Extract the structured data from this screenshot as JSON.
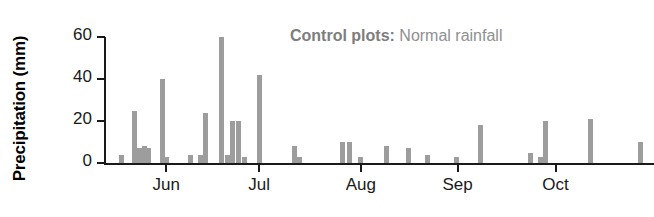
{
  "chart_data": {
    "type": "bar",
    "title": "",
    "subtitle": "",
    "xlabel": "",
    "ylabel": "Precipitation (mm)",
    "ylim": [
      0,
      60
    ],
    "yticks": [
      0,
      20,
      40,
      60
    ],
    "ytick_labels": [
      "0",
      "20",
      "40",
      "60"
    ],
    "grid": false,
    "legend_position": "top-right",
    "legend": [
      {
        "label_bold": "Control plots:",
        "label_normal": " Normal rainfall"
      }
    ],
    "bar_color": "#9d9d9d",
    "axis_color": "#1a1a1a",
    "x_axis_type": "date",
    "xtick_labels": [
      "Jun",
      "Jul",
      "Aug",
      "Sep",
      "Oct"
    ],
    "xtick_positions_frac": [
      0.113,
      0.282,
      0.467,
      0.643,
      0.821
    ],
    "x_note": "positions are fractions of the plot width, left edge = start of record",
    "series": [
      {
        "name": "Control plots: Normal rainfall",
        "units": "mm",
        "points": [
          {
            "x_frac": 0.031,
            "value": 4
          },
          {
            "x_frac": 0.056,
            "value": 25
          },
          {
            "x_frac": 0.064,
            "value": 7
          },
          {
            "x_frac": 0.073,
            "value": 8
          },
          {
            "x_frac": 0.08,
            "value": 7
          },
          {
            "x_frac": 0.107,
            "value": 40
          },
          {
            "x_frac": 0.113,
            "value": 3
          },
          {
            "x_frac": 0.158,
            "value": 4
          },
          {
            "x_frac": 0.175,
            "value": 4
          },
          {
            "x_frac": 0.184,
            "value": 24
          },
          {
            "x_frac": 0.213,
            "value": 60
          },
          {
            "x_frac": 0.224,
            "value": 4
          },
          {
            "x_frac": 0.233,
            "value": 20
          },
          {
            "x_frac": 0.244,
            "value": 20
          },
          {
            "x_frac": 0.255,
            "value": 3
          },
          {
            "x_frac": 0.282,
            "value": 42
          },
          {
            "x_frac": 0.347,
            "value": 8
          },
          {
            "x_frac": 0.355,
            "value": 3
          },
          {
            "x_frac": 0.433,
            "value": 10
          },
          {
            "x_frac": 0.447,
            "value": 10
          },
          {
            "x_frac": 0.467,
            "value": 3
          },
          {
            "x_frac": 0.513,
            "value": 8
          },
          {
            "x_frac": 0.553,
            "value": 7
          },
          {
            "x_frac": 0.589,
            "value": 4
          },
          {
            "x_frac": 0.64,
            "value": 3
          },
          {
            "x_frac": 0.684,
            "value": 18
          },
          {
            "x_frac": 0.775,
            "value": 5
          },
          {
            "x_frac": 0.793,
            "value": 3
          },
          {
            "x_frac": 0.802,
            "value": 20
          },
          {
            "x_frac": 0.884,
            "value": 21
          },
          {
            "x_frac": 0.975,
            "value": 10
          }
        ]
      }
    ]
  },
  "axis": {
    "y_title": "Precipitation (mm)"
  }
}
